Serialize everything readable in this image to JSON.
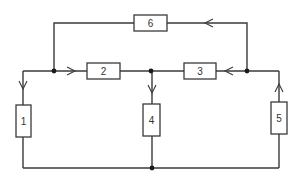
{
  "diagram": {
    "type": "circuit-network",
    "components": [
      {
        "id": "1",
        "label": "1",
        "orientation": "vertical",
        "x": 16,
        "y": 105,
        "w": 15,
        "h": 32
      },
      {
        "id": "2",
        "label": "2",
        "orientation": "horizontal",
        "x": 87,
        "y": 63,
        "w": 33,
        "h": 16
      },
      {
        "id": "3",
        "label": "3",
        "orientation": "horizontal",
        "x": 184,
        "y": 62,
        "w": 32,
        "h": 16
      },
      {
        "id": "4",
        "label": "4",
        "orientation": "vertical",
        "x": 143,
        "y": 104,
        "w": 17,
        "h": 32
      },
      {
        "id": "5",
        "label": "5",
        "orientation": "vertical",
        "x": 271,
        "y": 102,
        "w": 16,
        "h": 32
      },
      {
        "id": "6",
        "label": "6",
        "orientation": "horizontal",
        "x": 134,
        "y": 15,
        "w": 33,
        "h": 16
      }
    ],
    "nodes": [
      {
        "id": "A",
        "x": 54,
        "y": 71
      },
      {
        "id": "B",
        "x": 151,
        "y": 71
      },
      {
        "id": "C",
        "x": 247,
        "y": 71
      },
      {
        "id": "D",
        "x": 152,
        "y": 168
      }
    ],
    "arrows": [
      {
        "branch": "6",
        "direction": "left",
        "x": 208,
        "y": 23
      },
      {
        "branch": "2",
        "direction": "right",
        "x": 71,
        "y": 71
      },
      {
        "branch": "3",
        "direction": "left",
        "x": 229,
        "y": 71
      },
      {
        "branch": "1",
        "direction": "down",
        "x": 23,
        "y": 85
      },
      {
        "branch": "4",
        "direction": "down",
        "x": 152,
        "y": 89
      },
      {
        "branch": "5",
        "direction": "up",
        "x": 279,
        "y": 88
      }
    ],
    "colors": {
      "wire": "#3a3a3a",
      "node": "#1a1a1a",
      "background": "#ffffff"
    }
  }
}
